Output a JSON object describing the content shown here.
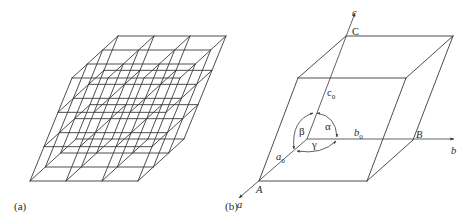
{
  "figure": {
    "panels": [
      {
        "id": "a",
        "label": "(a)",
        "description": "3x3x3 space lattice of parallelepiped unit cells",
        "lattice": {
          "origin": [
            30,
            181
          ],
          "vec_a": [
            36,
            0
          ],
          "vec_b": [
            15.33,
            -14
          ],
          "vec_c": [
            14,
            -34.33
          ],
          "cells": [
            3,
            3,
            3
          ]
        }
      },
      {
        "id": "b",
        "label": "(b)",
        "description": "Single unit cell with crystallographic axes and lattice parameters",
        "axes": {
          "a": {
            "label": "a"
          },
          "b": {
            "label": "b"
          },
          "c": {
            "label": "c"
          }
        },
        "points": {
          "A": "A",
          "B": "B",
          "C": "C"
        },
        "lengths": {
          "a0": {
            "base": "a",
            "sub": "0"
          },
          "b0": {
            "base": "b",
            "sub": "0"
          },
          "c0": {
            "base": "c",
            "sub": "0"
          }
        },
        "angles": {
          "alpha": "α",
          "beta": "β",
          "gamma": "γ"
        }
      }
    ],
    "colors": {
      "line": "#3a3a3a",
      "text": "#2a2a2a",
      "background": "#ffffff"
    }
  }
}
